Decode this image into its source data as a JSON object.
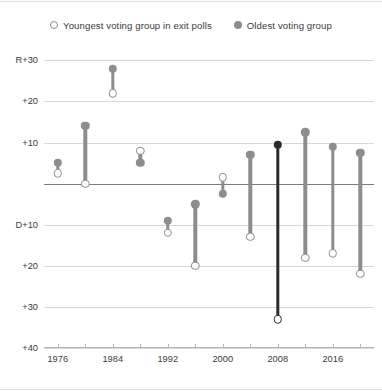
{
  "legend": {
    "items": [
      {
        "label": "Youngest voting group in exit polls",
        "marker": "open-circle-icon",
        "color": "#8d8d8d"
      },
      {
        "label": "Oldest voting group",
        "marker": "filled-circle-icon",
        "color": "#8d8d8d"
      }
    ]
  },
  "chart_data": {
    "type": "scatter",
    "title": "",
    "subtitle": "",
    "xlabel": "",
    "ylabel": "",
    "grid": true,
    "legend_position": "top-center",
    "x": [
      1976,
      1980,
      1984,
      1988,
      1992,
      1996,
      2000,
      2004,
      2008,
      2012,
      2016,
      2020
    ],
    "x_tick_labels": [
      "1976",
      "1984",
      "1992",
      "2000",
      "2008",
      "2016"
    ],
    "x_tick_values": [
      1976,
      1984,
      1992,
      2000,
      2008,
      2016
    ],
    "x_minor_tick_values": [
      1976,
      1980,
      1984,
      1988,
      1992,
      1996,
      2000,
      2004,
      2008,
      2012,
      2016,
      2020
    ],
    "xlim": [
      1974,
      2022
    ],
    "y_tick_labels": [
      "R+30",
      "+20",
      "+10",
      "",
      "D+10",
      "+20",
      "+30",
      "+40"
    ],
    "y_tick_values": [
      30,
      20,
      10,
      0,
      -10,
      -20,
      -30,
      -40
    ],
    "ylim": [
      -40,
      33
    ],
    "y_axis_note": "Positive values are Republican margin (R+), negative values are Democratic margin (D+)",
    "series": [
      {
        "name": "Oldest voting group",
        "marker": "filled-circle",
        "color": "#8d8d8d",
        "values": [
          5,
          14,
          28,
          5,
          -9,
          -5,
          -2.5,
          7,
          9.5,
          12.5,
          9,
          7.5
        ]
      },
      {
        "name": "Youngest voting group in exit polls",
        "marker": "open-circle",
        "color": "#8d8d8d",
        "values": [
          2.5,
          0,
          22,
          8,
          -12,
          -20,
          1.5,
          -13,
          -33,
          -18,
          -17,
          -22
        ]
      }
    ],
    "highlighted_x": 2008,
    "highlight_color": "#2b2b2b",
    "points": [
      {
        "year": 1976,
        "oldest": 5,
        "youngest": 2.5,
        "highlighted": false
      },
      {
        "year": 1980,
        "oldest": 14,
        "youngest": 0,
        "highlighted": false
      },
      {
        "year": 1984,
        "oldest": 28,
        "youngest": 22,
        "highlighted": false
      },
      {
        "year": 1988,
        "oldest": 5,
        "youngest": 8,
        "highlighted": false
      },
      {
        "year": 1992,
        "oldest": -9,
        "youngest": -12,
        "highlighted": false
      },
      {
        "year": 1996,
        "oldest": -5,
        "youngest": -20,
        "highlighted": false
      },
      {
        "year": 2000,
        "oldest": -2.5,
        "youngest": 1.5,
        "highlighted": false
      },
      {
        "year": 2004,
        "oldest": 7,
        "youngest": -13,
        "highlighted": false
      },
      {
        "year": 2008,
        "oldest": 9.5,
        "youngest": -33,
        "highlighted": true
      },
      {
        "year": 2012,
        "oldest": 12.5,
        "youngest": -18,
        "highlighted": false
      },
      {
        "year": 2016,
        "oldest": 9,
        "youngest": -17,
        "highlighted": false
      },
      {
        "year": 2020,
        "oldest": 7.5,
        "youngest": -22,
        "highlighted": false
      }
    ]
  }
}
